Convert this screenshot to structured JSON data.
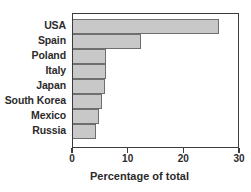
{
  "chart_data": {
    "type": "bar",
    "orientation": "horizontal",
    "title": "",
    "subtitle": "",
    "xlabel": "Percentage of total",
    "ylabel": "",
    "categories": [
      "USA",
      "Spain",
      "Poland",
      "Italy",
      "Japan",
      "South Korea",
      "Mexico",
      "Russia"
    ],
    "values": [
      26.2,
      12.2,
      6.0,
      6.0,
      5.8,
      5.2,
      4.7,
      4.1
    ],
    "xlim": [
      0,
      30
    ],
    "xticks": [
      0,
      10,
      20,
      30
    ],
    "xtick_labels": [
      "0",
      "10",
      "20",
      "30"
    ],
    "grid": false,
    "legend": null,
    "bar_fill_color": "#c8c8c8",
    "bar_edge_color": "#6e6e6e",
    "axis_color": "#3c3c3c",
    "text_color": "#2b2b2b"
  }
}
